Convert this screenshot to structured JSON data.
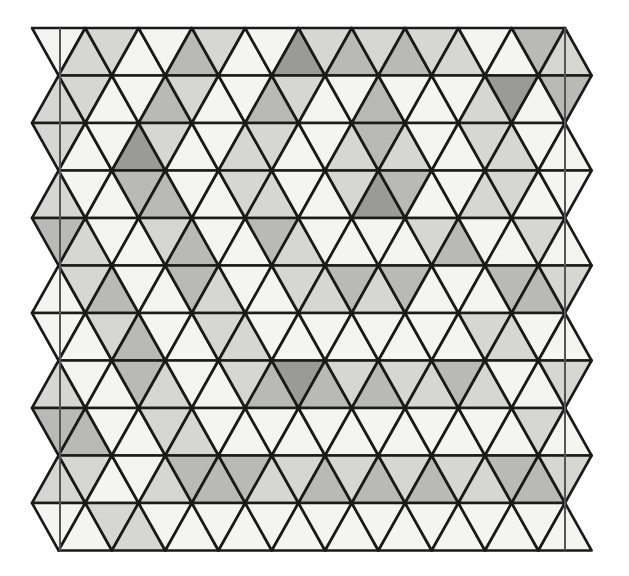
{
  "illustration": {
    "subject": "triangle quilt pattern",
    "rows": 11,
    "triangles_per_row": 20,
    "origin": {
      "x": 32,
      "y": 28
    },
    "triangle_width": 53.3,
    "row_height": 47.5,
    "guide_lines_x": [
      60,
      565
    ],
    "palette": {
      "0": "#f4f4f2",
      "1": "#d6d6d4",
      "2": "#b9b9b7",
      "3": "#9a9a98",
      "outline": "#1a1a1a",
      "guide": "#555555"
    },
    "shading": [
      [
        0,
        1,
        1,
        0,
        0,
        2,
        1,
        0,
        0,
        3,
        1,
        2,
        1,
        2,
        1,
        1,
        0,
        0,
        2,
        1
      ],
      [
        1,
        1,
        0,
        0,
        2,
        1,
        0,
        0,
        2,
        1,
        0,
        0,
        2,
        0,
        0,
        0,
        1,
        3,
        0,
        2
      ],
      [
        1,
        0,
        0,
        3,
        1,
        0,
        0,
        1,
        1,
        0,
        0,
        1,
        2,
        1,
        0,
        0,
        1,
        1,
        0,
        0
      ],
      [
        1,
        0,
        0,
        2,
        2,
        0,
        0,
        1,
        1,
        0,
        0,
        1,
        3,
        2,
        0,
        0,
        1,
        1,
        0,
        0
      ],
      [
        2,
        1,
        0,
        0,
        1,
        2,
        0,
        0,
        2,
        1,
        0,
        0,
        0,
        0,
        1,
        2,
        0,
        0,
        1,
        0
      ],
      [
        0,
        1,
        2,
        0,
        0,
        2,
        1,
        0,
        0,
        1,
        1,
        2,
        1,
        2,
        0,
        0,
        0,
        2,
        2,
        1
      ],
      [
        0,
        0,
        1,
        2,
        0,
        0,
        1,
        1,
        0,
        0,
        0,
        0,
        0,
        0,
        0,
        0,
        1,
        1,
        0,
        0
      ],
      [
        1,
        0,
        0,
        2,
        1,
        0,
        0,
        1,
        2,
        3,
        2,
        1,
        2,
        1,
        1,
        2,
        1,
        0,
        0,
        1
      ],
      [
        2,
        2,
        0,
        0,
        1,
        1,
        0,
        0,
        0,
        0,
        0,
        0,
        0,
        0,
        0,
        0,
        0,
        0,
        1,
        0
      ],
      [
        1,
        1,
        0,
        0,
        1,
        2,
        2,
        2,
        1,
        1,
        2,
        1,
        2,
        1,
        2,
        1,
        1,
        2,
        2,
        1
      ],
      [
        0,
        0,
        1,
        1,
        0,
        0,
        0,
        0,
        0,
        0,
        0,
        0,
        0,
        0,
        0,
        0,
        0,
        0,
        0,
        0
      ]
    ]
  }
}
